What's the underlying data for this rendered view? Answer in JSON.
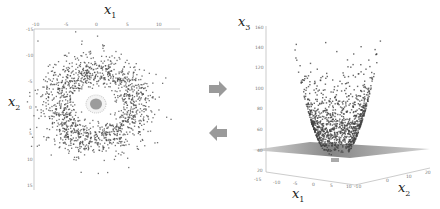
{
  "figure": {
    "left_panel": {
      "title": "2D scatter (x1 vs x2)",
      "xlabel": "x",
      "xlabel_sub": "1",
      "ylabel": "x",
      "ylabel_sub": "2",
      "xticks": [
        "-10",
        "-5",
        "0",
        "5",
        "10"
      ],
      "yticks": [
        "-15",
        "-10",
        "-5",
        "0",
        "5",
        "10",
        "15"
      ]
    },
    "arrows": {
      "forward": "right-arrow",
      "backward": "left-arrow",
      "color": "#9a9a9a"
    },
    "right_panel": {
      "title": "3D lifted scatter (x1, x2, x3)",
      "zlabel": "x",
      "zlabel_sub": "3",
      "xlabel": "x",
      "xlabel_sub": "1",
      "ylabel": "x",
      "ylabel_sub": "2",
      "zticks": [
        "160",
        "140",
        "120",
        "100",
        "80",
        "60",
        "40",
        "20"
      ],
      "xticks": [
        "-15",
        "-10",
        "-5",
        "0",
        "5",
        "10"
      ],
      "yticks": [
        "-10",
        "0",
        "10",
        "20"
      ],
      "plane_level": "40"
    },
    "colors": {
      "outer_points": "#444444",
      "inner_points": "#bbbbbb",
      "plane": "#8a8a8a",
      "axes": "#999999"
    }
  },
  "chart_data": [
    {
      "type": "scatter",
      "title": "",
      "xlabel": "x1",
      "ylabel": "x2",
      "xlim": [
        -10,
        10
      ],
      "ylim": [
        -15,
        15
      ],
      "x_ticks": [
        -10,
        -5,
        0,
        5,
        10
      ],
      "y_ticks": [
        -15,
        -10,
        -5,
        0,
        5,
        10,
        15
      ],
      "series": [
        {
          "name": "outer ring class (x markers)",
          "description": "dense annulus of points roughly radius 2–8 centered at origin"
        },
        {
          "name": "inner class (o markers)",
          "description": "small cluster radius < 1.5 centered at origin, surrounded by light ring"
        }
      ]
    },
    {
      "type": "scatter",
      "title": "",
      "xlabel": "x1",
      "ylabel": "x2",
      "zlabel": "x3",
      "zlim": [
        20,
        160
      ],
      "x_ticks": [
        -15,
        -10,
        -5,
        0,
        5,
        10
      ],
      "y_ticks": [
        -10,
        0,
        10,
        20
      ],
      "z_ticks": [
        20,
        40,
        60,
        80,
        100,
        120,
        140,
        160
      ],
      "series": [
        {
          "name": "outer ring class",
          "description": "points lifted onto paraboloid x3 = x1^2 + x2^2, spanning z ≈ 40–145"
        },
        {
          "name": "inner class",
          "description": "points near z ≈ 35, below separating plane"
        }
      ],
      "separating_plane_z": 40
    }
  ]
}
